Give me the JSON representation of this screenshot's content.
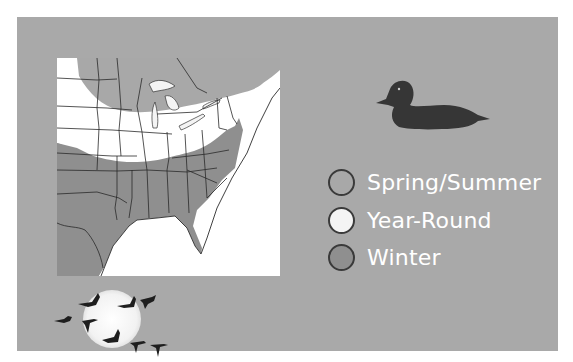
{
  "figure": {
    "panel_color": "#a9a9a9"
  },
  "map": {
    "region": "Eastern United States",
    "shading": {
      "spring_summer": "#a8a8a8",
      "year_round": "#ffffff",
      "winter": "#8f8f8f"
    }
  },
  "legend": {
    "items": [
      {
        "label": "Spring/Summer",
        "color": "#a8a8a8"
      },
      {
        "label": "Year-Round",
        "color": "#f4f4f4"
      },
      {
        "label": "Winter",
        "color": "#8f8f8f"
      }
    ]
  },
  "illustrations": {
    "top_right": "duck-silhouette",
    "bottom_left": "geese-flock-over-moon"
  }
}
